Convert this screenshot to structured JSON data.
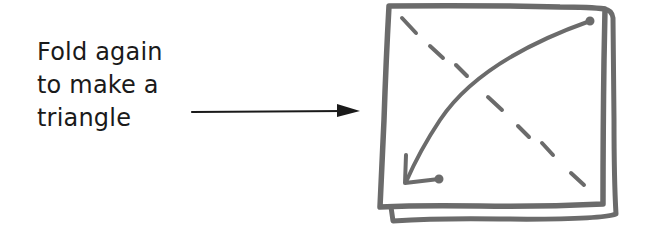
{
  "instruction": {
    "lines": [
      "Fold again",
      "to make a",
      "triangle"
    ]
  },
  "figure": {
    "stroke_color": "#6b6b6b",
    "pointer_arrow_color": "#1a1a1a",
    "text_color": "#1a1a1a",
    "background": "#ffffff"
  }
}
